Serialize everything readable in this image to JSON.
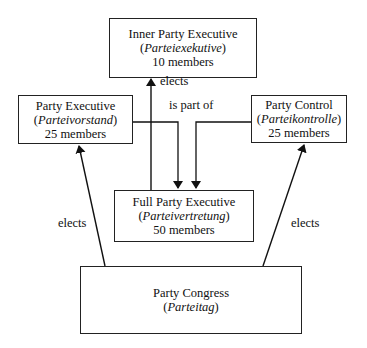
{
  "diagram": {
    "type": "organizational-flowchart",
    "nodes": [
      {
        "id": "inner",
        "title": "Inner Party Executive",
        "german": "Parteiexekutive",
        "members": "10 members"
      },
      {
        "id": "exec",
        "title": "Party Executive",
        "german": "Parteivorstand",
        "members": "25 members"
      },
      {
        "id": "control",
        "title": "Party Control",
        "german": "Parteikontrolle",
        "members": "25 members"
      },
      {
        "id": "full",
        "title": "Full Party Executive",
        "german": "Parteivertretung",
        "members": "50 members"
      },
      {
        "id": "congress",
        "title": "Party Congress",
        "german": "Parteitag"
      }
    ],
    "edges": [
      {
        "from": "full",
        "to": "inner",
        "label": "elects"
      },
      {
        "from": "exec",
        "to": "full",
        "label": "is part of"
      },
      {
        "from": "control",
        "to": "full",
        "label": "is part of"
      },
      {
        "from": "congress",
        "to": "exec",
        "label": "elects"
      },
      {
        "from": "congress",
        "to": "control",
        "label": "elects"
      }
    ],
    "labels": {
      "elects_top": "elects",
      "is_part_of": "is part of",
      "elects_left": "elects",
      "elects_right": "elects"
    },
    "paren_open": "(",
    "paren_close": ")"
  }
}
